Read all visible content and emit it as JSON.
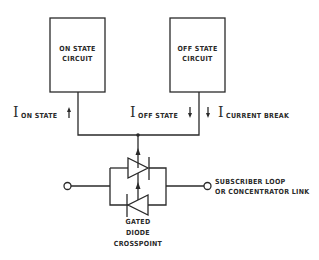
{
  "diagram": {
    "boxes": [
      {
        "id": "on-state",
        "line1": "ON STATE",
        "line2": "CIRCUIT"
      },
      {
        "id": "off-state",
        "line1": "OFF STATE",
        "line2": "CIRCUIT"
      }
    ],
    "currents": [
      {
        "symbol": "I",
        "subscript": "ON STATE",
        "arrow": "up"
      },
      {
        "symbol": "I",
        "subscript": "OFF STATE",
        "arrow": "down"
      },
      {
        "symbol": "I",
        "subscript": "CURRENT BREAK",
        "arrow": "down"
      }
    ],
    "crosspoint_label": [
      "GATED",
      "DIODE",
      "CROSSPOINT"
    ],
    "right_terminal_label": [
      "SUBSCRIBER LOOP",
      "OR CONCENTRATOR LINK"
    ],
    "colors": {
      "ink": "#2a2a2a",
      "background": "#ffffff"
    }
  }
}
